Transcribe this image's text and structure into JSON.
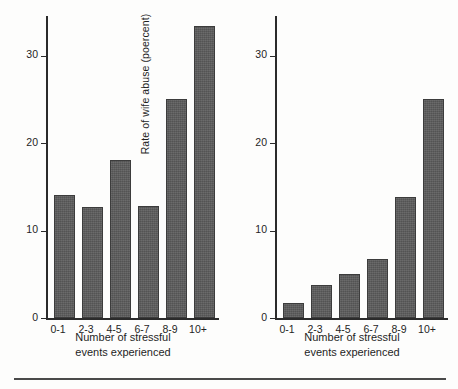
{
  "figure": {
    "background": "#fdfdfc",
    "bar_color": "#5b5b5b",
    "bar_edge_color": "#3c3c3c",
    "axis_color": "#2b2b2b"
  },
  "shared": {
    "xlabel_line1": "Number of stressful",
    "xlabel_line2": "events experienced",
    "categories": [
      "0-1",
      "2-3",
      "4-5",
      "6-7",
      "8-9",
      "10+"
    ],
    "y_ticks": [
      "0",
      "10",
      "20",
      "30"
    ]
  },
  "chart_data": [
    {
      "type": "bar",
      "title": "",
      "ylabel": "Rate of child abuse (poercent)",
      "xlabel": "Number of stressful events experienced",
      "categories": [
        "0-1",
        "2-3",
        "4-5",
        "6-7",
        "8-9",
        "10+"
      ],
      "values": [
        14,
        12.7,
        18,
        12.8,
        25,
        33.4
      ],
      "ytick_labels": [
        "0",
        "10",
        "20",
        "30"
      ],
      "ytick_values": [
        0,
        10,
        20,
        30
      ],
      "ylim": [
        0,
        34.5
      ],
      "grid": false,
      "legend": null
    },
    {
      "type": "bar",
      "title": "",
      "ylabel": "Rate of wife abuse (poercent)",
      "xlabel": "Number of stressful events experienced",
      "categories": [
        "0-1",
        "2-3",
        "4-5",
        "6-7",
        "8-9",
        "10+"
      ],
      "values": [
        1.7,
        3.8,
        5.0,
        6.7,
        13.8,
        25.0
      ],
      "ytick_labels": [
        "0",
        "10",
        "20",
        "30"
      ],
      "ytick_values": [
        0,
        10,
        20,
        30
      ],
      "ylim": [
        0,
        34.5
      ],
      "grid": false,
      "legend": null
    }
  ]
}
